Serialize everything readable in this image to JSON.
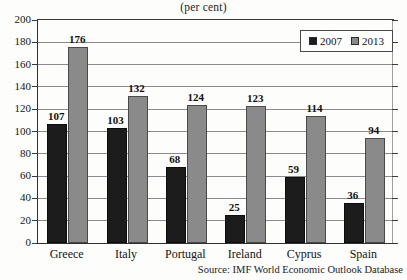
{
  "chart_data": {
    "type": "bar",
    "title": "(per cent)",
    "xlabel": "",
    "ylabel": "",
    "ylim": [
      0,
      200
    ],
    "ytick_step": 20,
    "yticks": [
      0,
      20,
      40,
      60,
      80,
      100,
      120,
      140,
      160,
      180,
      200
    ],
    "grid": true,
    "legend_position": "top-right",
    "categories": [
      "Greece",
      "Italy",
      "Portugal",
      "Ireland",
      "Cyprus",
      "Spain"
    ],
    "series": [
      {
        "name": "2007",
        "color": "#1c1c1c",
        "values": [
          107,
          103,
          68,
          25,
          59,
          36
        ]
      },
      {
        "name": "2013",
        "color": "#8a8a8a",
        "values": [
          176,
          132,
          124,
          123,
          114,
          94
        ]
      }
    ],
    "source": "Source: IMF World Economic Outlook Database"
  },
  "colors": {
    "series_2007": "#1c1c1c",
    "series_2013": "#8a8a8a",
    "axis": "#303030",
    "grid": "#6e6e6e",
    "background": "#fdfdfc"
  }
}
